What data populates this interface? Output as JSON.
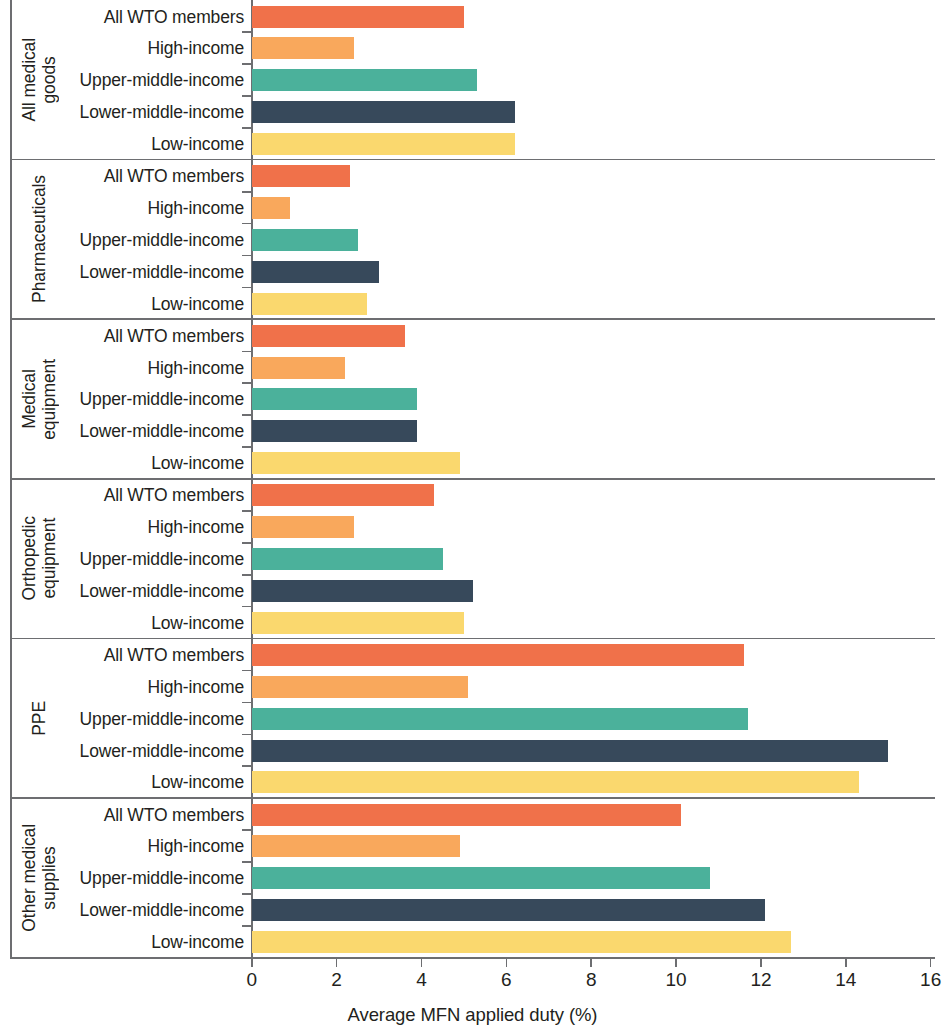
{
  "chart_data": {
    "type": "bar",
    "orientation": "horizontal",
    "title": "",
    "xlabel": "Average MFN applied duty (%)",
    "ylabel": "",
    "xlim": [
      0,
      16
    ],
    "xticks": [
      0,
      2,
      4,
      6,
      8,
      10,
      12,
      14,
      16
    ],
    "xtick_labels": [
      "0",
      "2",
      "4",
      "6",
      "8",
      "10",
      "12",
      "14",
      "16"
    ],
    "grid": false,
    "legend": "none",
    "categories": [
      "All WTO members",
      "High-income",
      "Upper-middle-income",
      "Lower-middle-income",
      "Low-income"
    ],
    "category_colors": [
      "#F0714A",
      "#F9A85C",
      "#4BB19B",
      "#37495B",
      "#FAD86E"
    ],
    "groups": [
      {
        "name": "All medical goods",
        "name_lines": "All medical\ngoods",
        "values": [
          5.0,
          2.4,
          5.3,
          6.2,
          6.2
        ]
      },
      {
        "name": "Pharmaceuticals",
        "name_lines": "Pharmaceuticals",
        "values": [
          2.3,
          0.9,
          2.5,
          3.0,
          2.7
        ]
      },
      {
        "name": "Medical equipment",
        "name_lines": "Medical\nequipment",
        "values": [
          3.6,
          2.2,
          3.9,
          3.9,
          4.9
        ]
      },
      {
        "name": "Orthopedic equipment",
        "name_lines": "Orthopedic\nequipment",
        "values": [
          4.3,
          2.4,
          4.5,
          5.2,
          5.0
        ]
      },
      {
        "name": "PPE",
        "name_lines": "PPE",
        "values": [
          11.6,
          5.1,
          11.7,
          15.0,
          14.3
        ]
      },
      {
        "name": "Other medical supplies",
        "name_lines": "Other medical\nsupplies",
        "values": [
          10.1,
          4.9,
          10.8,
          12.1,
          12.7
        ]
      }
    ]
  }
}
